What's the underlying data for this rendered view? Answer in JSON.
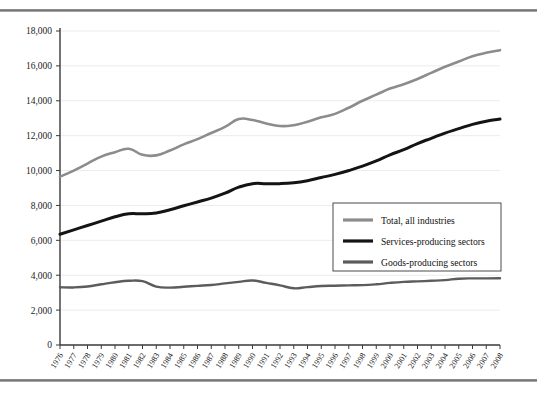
{
  "chart_data": {
    "type": "line",
    "title": "",
    "xlabel": "",
    "ylabel": "",
    "ylim": [
      0,
      18000
    ],
    "ytick_step": 2000,
    "ytick_labels": [
      "0",
      "2,000",
      "4,000",
      "6,000",
      "8,000",
      "10,000",
      "12,000",
      "14,000",
      "16,000",
      "18,000"
    ],
    "grid": "horizontal",
    "legend_position": "center-right",
    "categories": [
      "1976",
      "1977",
      "1978",
      "1979",
      "1980",
      "1981",
      "1982",
      "1983",
      "1984",
      "1986",
      "1985",
      "1987",
      "1988",
      "1989",
      "1990",
      "1991",
      "1992",
      "1993",
      "1994",
      "1995",
      "1996",
      "1997",
      "1998",
      "1999",
      "2000",
      "2001",
      "2002",
      "2003",
      "2004",
      "2005",
      "2006",
      "2007",
      "2008"
    ],
    "x": [
      1976,
      1977,
      1978,
      1979,
      1980,
      1981,
      1982,
      1983,
      1984,
      1985,
      1986,
      1987,
      1988,
      1989,
      1990,
      1991,
      1992,
      1993,
      1994,
      1995,
      1996,
      1997,
      1998,
      1999,
      2000,
      2001,
      2002,
      2003,
      2004,
      2005,
      2006,
      2007,
      2008
    ],
    "series": [
      {
        "name": "Total, all industries",
        "color": "#8c8c8c",
        "values": [
          9650,
          10000,
          10400,
          10800,
          11050,
          11250,
          10900,
          10870,
          11150,
          11500,
          11800,
          12150,
          12500,
          12950,
          12900,
          12700,
          12550,
          12600,
          12800,
          13050,
          13250,
          13600,
          14000,
          14350,
          14700,
          14950,
          15250,
          15600,
          15950,
          16250,
          16550,
          16750,
          16900
        ]
      },
      {
        "name": "Services-producing sectors",
        "color": "#141414",
        "values": [
          6350,
          6600,
          6850,
          7100,
          7350,
          7520,
          7520,
          7570,
          7750,
          7980,
          8200,
          8420,
          8700,
          9050,
          9250,
          9250,
          9250,
          9300,
          9420,
          9600,
          9780,
          10000,
          10250,
          10550,
          10900,
          11200,
          11550,
          11850,
          12150,
          12400,
          12650,
          12830,
          12950
        ]
      },
      {
        "name": "Goods-producing sectors",
        "color": "#5c5c5c",
        "values": [
          3310,
          3300,
          3350,
          3480,
          3600,
          3680,
          3660,
          3350,
          3290,
          3340,
          3390,
          3440,
          3530,
          3620,
          3700,
          3560,
          3420,
          3250,
          3320,
          3380,
          3400,
          3420,
          3430,
          3480,
          3560,
          3620,
          3650,
          3680,
          3720,
          3800,
          3820,
          3820,
          3830
        ]
      }
    ]
  },
  "legend": {
    "entries": [
      {
        "label": "Total, all industries"
      },
      {
        "label": "Services-producing sectors"
      },
      {
        "label": "Goods-producing sectors"
      }
    ]
  }
}
